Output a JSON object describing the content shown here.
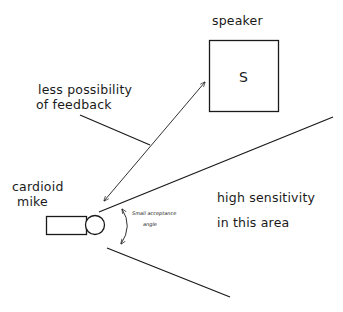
{
  "diagram": {
    "type": "cardioid-microphone-pickup-diagram",
    "labels": {
      "speaker": "speaker",
      "speaker_symbol": "S",
      "feedback_line1": "less possibility",
      "feedback_line2": "of feedback",
      "mic_line1": "cardioid",
      "mic_line2": "mike",
      "angle_line1": "Small acceptance",
      "angle_line2": "angle",
      "area_line1": "high sensitivity",
      "area_line2": "in this area"
    },
    "colors": {
      "stroke": "#1a1a1a",
      "background": "#ffffff"
    }
  }
}
